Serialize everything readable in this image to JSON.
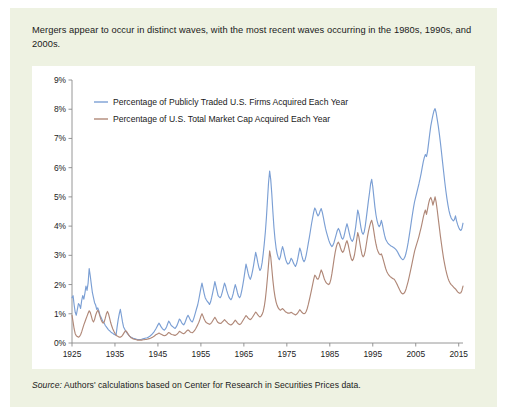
{
  "figure": {
    "caption": "Mergers appear to occur in distinct waves, with the most recent waves occurring in the 1980s, 1990s, and 2000s.",
    "source_label": "Source:",
    "source_text": " Authors' calculations based on Center for Research in Securities Prices data.",
    "panel_color": "#eef2e2",
    "plot_background": "#ffffff"
  },
  "chart_data": {
    "type": "line",
    "title": "",
    "subtitle": "",
    "xlabel": "",
    "ylabel": "",
    "xlim": [
      1925,
      2016
    ],
    "ylim": [
      0,
      9
    ],
    "grid": false,
    "legend_position": "top-left-inside",
    "x_ticks": [
      1925,
      1935,
      1945,
      1955,
      1965,
      1975,
      1985,
      1995,
      2005,
      2015
    ],
    "x_tick_labels": [
      "1925",
      "1935",
      "1945",
      "1955",
      "1965",
      "1975",
      "1985",
      "1995",
      "2005",
      "2015"
    ],
    "y_ticks": [
      0,
      1,
      2,
      3,
      4,
      5,
      6,
      7,
      8,
      9
    ],
    "y_tick_labels": [
      "0%",
      "1%",
      "2%",
      "3%",
      "4%",
      "5%",
      "6%",
      "7%",
      "8%",
      "9%"
    ],
    "series": [
      {
        "name": "Percentage of Publicly Traded U.S. Firms Acquired Each Year",
        "color": "#7b9fd4",
        "x_start": 1925.0,
        "x_step": 0.25,
        "values": [
          1.55,
          1.62,
          1.3,
          1.05,
          0.95,
          1.15,
          1.35,
          1.3,
          1.18,
          1.45,
          1.62,
          1.5,
          1.7,
          1.95,
          1.8,
          2.05,
          2.55,
          2.3,
          2.0,
          1.72,
          1.55,
          1.38,
          1.3,
          1.15,
          1.2,
          1.1,
          0.95,
          0.88,
          0.8,
          0.72,
          0.68,
          0.6,
          0.55,
          0.5,
          0.45,
          0.42,
          0.38,
          0.35,
          0.33,
          0.3,
          0.28,
          0.26,
          0.55,
          0.8,
          1.0,
          1.15,
          0.95,
          0.72,
          0.55,
          0.48,
          0.4,
          0.35,
          0.3,
          0.26,
          0.22,
          0.2,
          0.18,
          0.16,
          0.15,
          0.14,
          0.13,
          0.12,
          0.12,
          0.12,
          0.12,
          0.13,
          0.14,
          0.15,
          0.16,
          0.17,
          0.18,
          0.2,
          0.22,
          0.25,
          0.28,
          0.32,
          0.36,
          0.42,
          0.48,
          0.55,
          0.62,
          0.68,
          0.62,
          0.55,
          0.5,
          0.46,
          0.44,
          0.48,
          0.55,
          0.65,
          0.75,
          0.7,
          0.62,
          0.58,
          0.55,
          0.52,
          0.5,
          0.55,
          0.62,
          0.72,
          0.82,
          0.78,
          0.7,
          0.65,
          0.62,
          0.68,
          0.78,
          0.88,
          0.95,
          0.88,
          0.8,
          0.75,
          0.72,
          0.8,
          0.92,
          1.05,
          1.18,
          1.3,
          1.48,
          1.68,
          1.88,
          2.05,
          1.88,
          1.7,
          1.55,
          1.48,
          1.42,
          1.38,
          1.32,
          1.4,
          1.55,
          1.72,
          1.9,
          2.1,
          1.95,
          1.78,
          1.62,
          1.58,
          1.55,
          1.62,
          1.75,
          1.9,
          2.05,
          1.95,
          1.8,
          1.68,
          1.58,
          1.52,
          1.48,
          1.55,
          1.68,
          1.85,
          2.0,
          1.88,
          1.72,
          1.6,
          1.55,
          1.62,
          1.78,
          1.98,
          2.2,
          2.45,
          2.7,
          2.55,
          2.38,
          2.25,
          2.18,
          2.28,
          2.45,
          2.65,
          2.88,
          3.1,
          2.95,
          2.75,
          2.58,
          2.48,
          2.55,
          2.75,
          3.05,
          3.4,
          3.8,
          4.3,
          4.9,
          5.5,
          5.88,
          5.6,
          5.1,
          4.5,
          3.95,
          3.55,
          3.25,
          3.05,
          2.92,
          2.85,
          2.95,
          3.15,
          3.3,
          3.18,
          3.0,
          2.85,
          2.75,
          2.7,
          2.72,
          2.8,
          2.9,
          2.85,
          2.75,
          2.68,
          2.62,
          2.7,
          2.85,
          3.05,
          3.25,
          3.15,
          2.98,
          2.85,
          2.78,
          2.85,
          3.0,
          3.2,
          3.42,
          3.62,
          3.85,
          4.08,
          4.28,
          4.48,
          4.62,
          4.55,
          4.42,
          4.35,
          4.4,
          4.52,
          4.6,
          4.48,
          4.3,
          4.1,
          3.92,
          3.78,
          3.65,
          3.52,
          3.42,
          3.35,
          3.3,
          3.35,
          3.45,
          3.58,
          3.72,
          3.85,
          3.92,
          3.85,
          3.72,
          3.6,
          3.55,
          3.62,
          3.78,
          3.95,
          4.08,
          3.95,
          3.78,
          3.62,
          3.52,
          3.48,
          3.55,
          3.72,
          3.95,
          4.25,
          4.55,
          4.42,
          4.18,
          3.95,
          3.78,
          3.72,
          3.8,
          4.0,
          4.28,
          4.58,
          4.88,
          5.15,
          5.45,
          5.6,
          5.35,
          5.0,
          4.65,
          4.38,
          4.18,
          4.05,
          3.98,
          4.05,
          4.2,
          4.05,
          3.85,
          3.68,
          3.55,
          3.48,
          3.42,
          3.38,
          3.35,
          3.32,
          3.3,
          3.28,
          3.25,
          3.22,
          3.18,
          3.12,
          3.05,
          2.98,
          2.92,
          2.88,
          2.85,
          2.88,
          2.95,
          3.08,
          3.25,
          3.45,
          3.68,
          3.92,
          4.18,
          4.42,
          4.65,
          4.85,
          5.0,
          5.15,
          5.3,
          5.45,
          5.62,
          5.8,
          6.0,
          6.2,
          6.35,
          6.45,
          6.38,
          6.55,
          6.85,
          7.15,
          7.42,
          7.62,
          7.8,
          7.95,
          8.02,
          7.88,
          7.65,
          7.42,
          7.15,
          6.85,
          6.52,
          6.18,
          5.85,
          5.52,
          5.22,
          4.95,
          4.72,
          4.52,
          4.38,
          4.28,
          4.22,
          4.18,
          4.22,
          4.35,
          4.18,
          4.05,
          3.95,
          3.88,
          3.85,
          3.92,
          4.1,
          4.38,
          4.72,
          5.05,
          5.35,
          5.55,
          5.4,
          5.08,
          4.72,
          4.42,
          4.18,
          4.0,
          3.88,
          3.78,
          3.72,
          3.68,
          3.65,
          3.62,
          3.58,
          3.55,
          3.52,
          3.48,
          3.45,
          3.42,
          3.4,
          3.5,
          3.68,
          3.85,
          3.75,
          3.58,
          3.45,
          3.55,
          3.72,
          3.88,
          3.78,
          3.6,
          3.45,
          3.38,
          3.32,
          3.3,
          3.28,
          3.3,
          3.32,
          3.3,
          3.28,
          3.26,
          3.25,
          3.28,
          3.32,
          3.3
        ]
      },
      {
        "name": "Percentage of U.S. Total Market Cap Acquired Each Year",
        "color": "#b08878",
        "x_start": 1925.0,
        "x_step": 0.25,
        "values": [
          0.95,
          0.72,
          0.48,
          0.32,
          0.25,
          0.22,
          0.2,
          0.22,
          0.28,
          0.38,
          0.5,
          0.62,
          0.72,
          0.82,
          0.92,
          1.02,
          1.1,
          1.05,
          0.92,
          0.78,
          0.72,
          0.8,
          0.95,
          1.05,
          1.12,
          1.05,
          0.92,
          0.8,
          0.72,
          0.68,
          0.72,
          0.85,
          1.0,
          1.08,
          1.0,
          0.85,
          0.7,
          0.58,
          0.48,
          0.4,
          0.33,
          0.28,
          0.24,
          0.22,
          0.2,
          0.2,
          0.22,
          0.26,
          0.32,
          0.38,
          0.42,
          0.38,
          0.32,
          0.26,
          0.22,
          0.18,
          0.16,
          0.14,
          0.13,
          0.12,
          0.11,
          0.1,
          0.1,
          0.1,
          0.1,
          0.1,
          0.11,
          0.11,
          0.12,
          0.12,
          0.13,
          0.14,
          0.15,
          0.16,
          0.18,
          0.2,
          0.22,
          0.25,
          0.28,
          0.3,
          0.32,
          0.34,
          0.32,
          0.3,
          0.28,
          0.26,
          0.25,
          0.26,
          0.28,
          0.32,
          0.36,
          0.34,
          0.31,
          0.29,
          0.28,
          0.27,
          0.26,
          0.28,
          0.31,
          0.35,
          0.4,
          0.38,
          0.35,
          0.33,
          0.32,
          0.34,
          0.38,
          0.42,
          0.45,
          0.42,
          0.38,
          0.36,
          0.35,
          0.38,
          0.42,
          0.48,
          0.55,
          0.62,
          0.7,
          0.8,
          0.92,
          1.0,
          0.92,
          0.82,
          0.75,
          0.7,
          0.68,
          0.66,
          0.64,
          0.66,
          0.7,
          0.76,
          0.82,
          0.88,
          0.82,
          0.75,
          0.7,
          0.68,
          0.67,
          0.68,
          0.72,
          0.76,
          0.8,
          0.76,
          0.72,
          0.68,
          0.65,
          0.63,
          0.62,
          0.64,
          0.68,
          0.73,
          0.78,
          0.74,
          0.69,
          0.65,
          0.63,
          0.65,
          0.7,
          0.76,
          0.82,
          0.88,
          0.94,
          0.9,
          0.85,
          0.82,
          0.8,
          0.83,
          0.88,
          0.94,
          1.0,
          1.06,
          1.02,
          0.96,
          0.92,
          0.89,
          0.92,
          0.98,
          1.08,
          1.25,
          1.5,
          1.85,
          2.25,
          2.7,
          3.15,
          2.95,
          2.55,
          2.15,
          1.82,
          1.58,
          1.4,
          1.28,
          1.2,
          1.15,
          1.12,
          1.15,
          1.18,
          1.14,
          1.1,
          1.06,
          1.04,
          1.02,
          1.02,
          1.03,
          1.05,
          1.03,
          1.0,
          0.98,
          0.96,
          0.98,
          1.02,
          1.08,
          1.14,
          1.1,
          1.05,
          1.02,
          1.0,
          1.02,
          1.08,
          1.18,
          1.32,
          1.48,
          1.65,
          1.82,
          2.0,
          2.18,
          2.32,
          2.28,
          2.2,
          2.18,
          2.25,
          2.38,
          2.5,
          2.42,
          2.3,
          2.18,
          2.1,
          2.05,
          2.02,
          2.0,
          2.05,
          2.18,
          2.38,
          2.62,
          2.88,
          3.1,
          3.28,
          3.4,
          3.45,
          3.38,
          3.25,
          3.15,
          3.1,
          3.15,
          3.28,
          3.42,
          3.5,
          3.38,
          3.2,
          3.02,
          2.88,
          2.82,
          2.88,
          3.02,
          3.25,
          3.52,
          3.78,
          3.65,
          3.42,
          3.2,
          3.02,
          2.95,
          3.0,
          3.15,
          3.38,
          3.62,
          3.82,
          3.98,
          4.12,
          4.2,
          4.05,
          3.82,
          3.58,
          3.38,
          3.22,
          3.12,
          3.05,
          3.02,
          3.05,
          2.95,
          2.82,
          2.68,
          2.55,
          2.45,
          2.38,
          2.32,
          2.28,
          2.25,
          2.22,
          2.2,
          2.18,
          2.12,
          2.05,
          1.98,
          1.9,
          1.82,
          1.75,
          1.7,
          1.68,
          1.7,
          1.75,
          1.85,
          1.98,
          2.12,
          2.28,
          2.45,
          2.62,
          2.8,
          2.98,
          3.15,
          3.28,
          3.4,
          3.52,
          3.65,
          3.8,
          3.95,
          4.12,
          4.3,
          4.45,
          4.55,
          4.4,
          4.58,
          4.78,
          4.92,
          4.98,
          4.88,
          4.72,
          4.85,
          5.0,
          4.82,
          4.55,
          4.25,
          3.95,
          3.65,
          3.38,
          3.12,
          2.88,
          2.68,
          2.5,
          2.35,
          2.22,
          2.12,
          2.05,
          2.0,
          1.96,
          1.92,
          1.88,
          1.85,
          1.8,
          1.75,
          1.72,
          1.7,
          1.72,
          1.8,
          1.95,
          2.15,
          2.4,
          2.62,
          2.8,
          2.92,
          2.82,
          2.62,
          2.42,
          2.25,
          2.12,
          2.02,
          1.95,
          1.9,
          1.92,
          2.0,
          2.05,
          1.95,
          1.82,
          1.7,
          1.6,
          1.52,
          1.45,
          1.4,
          1.35,
          1.32,
          1.28,
          1.25,
          1.22,
          1.2,
          1.18,
          1.22,
          1.28,
          1.35,
          1.3,
          1.22,
          1.15,
          1.1,
          1.06,
          1.02,
          1.0,
          0.98,
          0.96,
          0.98,
          1.05,
          1.2,
          1.42,
          1.62,
          1.75,
          1.8
        ]
      }
    ]
  }
}
